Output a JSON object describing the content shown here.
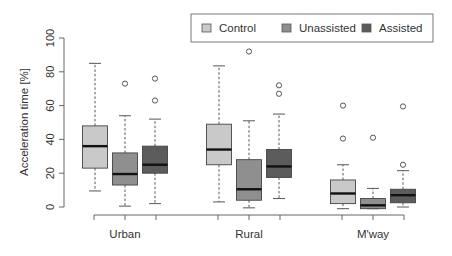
{
  "chart_data": {
    "type": "box",
    "title": "",
    "xlabel": "",
    "ylabel": "Acceleration time [%]",
    "ylim": [
      0,
      100
    ],
    "yticks": [
      0,
      20,
      40,
      60,
      80,
      100
    ],
    "categories": [
      "Urban",
      "Rural",
      "M'way"
    ],
    "legend": {
      "position": "top-right",
      "entries": [
        "Control",
        "Unassisted",
        "Assisted"
      ]
    },
    "series": [
      {
        "name": "Control",
        "color": "#c9c9c9",
        "boxes": [
          {
            "category": "Urban",
            "whisker_low": 9.5,
            "q1": 23,
            "median": 36,
            "q3": 48,
            "whisker_high": 85,
            "outliers": []
          },
          {
            "category": "Rural",
            "whisker_low": 3,
            "q1": 25,
            "median": 34,
            "q3": 49,
            "whisker_high": 83.5,
            "outliers": []
          },
          {
            "category": "M'way",
            "whisker_low": -1,
            "q1": 2,
            "median": 8,
            "q3": 16,
            "whisker_high": 25,
            "outliers": [
              40.5,
              60
            ]
          }
        ]
      },
      {
        "name": "Unassisted",
        "color": "#8f8f8f",
        "boxes": [
          {
            "category": "Urban",
            "whisker_low": 0.5,
            "q1": 13,
            "median": 19.5,
            "q3": 32,
            "whisker_high": 54,
            "outliers": [
              73
            ]
          },
          {
            "category": "Rural",
            "whisker_low": -0.5,
            "q1": 4,
            "median": 10.5,
            "q3": 28,
            "whisker_high": 51,
            "outliers": [
              92
            ]
          },
          {
            "category": "M'way",
            "whisker_low": -1,
            "q1": -1,
            "median": 1,
            "q3": 5,
            "whisker_high": 11,
            "outliers": [
              41
            ]
          }
        ]
      },
      {
        "name": "Assisted",
        "color": "#5c5c5c",
        "boxes": [
          {
            "category": "Urban",
            "whisker_low": 2,
            "q1": 20,
            "median": 25,
            "q3": 36,
            "whisker_high": 52,
            "outliers": [
              63,
              76
            ]
          },
          {
            "category": "Rural",
            "whisker_low": 5,
            "q1": 17.5,
            "median": 24,
            "q3": 34,
            "whisker_high": 55,
            "outliers": [
              67,
              72
            ]
          },
          {
            "category": "M'way",
            "whisker_low": 0,
            "q1": 2.5,
            "median": 7,
            "q3": 10.5,
            "whisker_high": 21.5,
            "outliers": [
              25,
              59.5
            ]
          }
        ]
      }
    ]
  }
}
